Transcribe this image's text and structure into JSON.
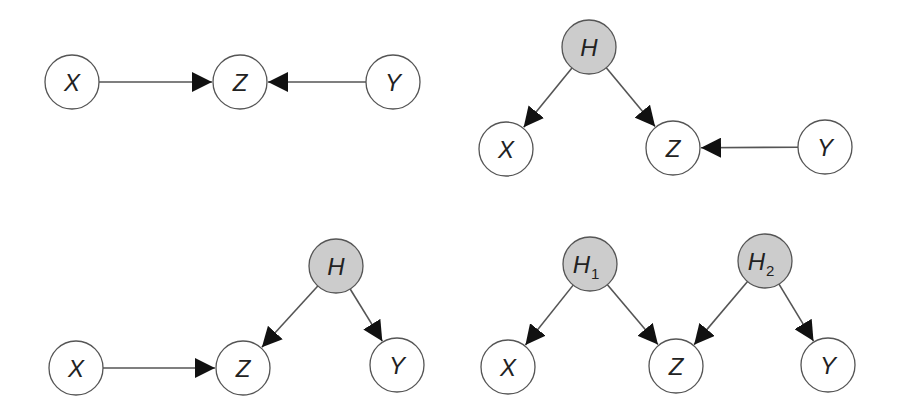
{
  "colors": {
    "observed_fill": "#ffffff",
    "hidden_fill": "#cccccc",
    "stroke": "#555555",
    "arrowhead": "#111111"
  },
  "node_radius": 27,
  "graphs": [
    {
      "id": "graph-1",
      "nodes": [
        {
          "id": "X",
          "label": "X",
          "sub": "",
          "x": 72,
          "y": 82,
          "hidden": false
        },
        {
          "id": "Z",
          "label": "Z",
          "sub": "",
          "x": 240,
          "y": 82,
          "hidden": false
        },
        {
          "id": "Y",
          "label": "Y",
          "sub": "",
          "x": 393,
          "y": 82,
          "hidden": false
        }
      ],
      "edges": [
        {
          "from": "X",
          "to": "Z"
        },
        {
          "from": "Y",
          "to": "Z"
        }
      ]
    },
    {
      "id": "graph-2",
      "nodes": [
        {
          "id": "H",
          "label": "H",
          "sub": "",
          "x": 589,
          "y": 47,
          "hidden": true
        },
        {
          "id": "X",
          "label": "X",
          "sub": "",
          "x": 506,
          "y": 149,
          "hidden": false
        },
        {
          "id": "Z",
          "label": "Z",
          "sub": "",
          "x": 673,
          "y": 148,
          "hidden": false
        },
        {
          "id": "Y",
          "label": "Y",
          "sub": "",
          "x": 825,
          "y": 147,
          "hidden": false
        }
      ],
      "edges": [
        {
          "from": "H",
          "to": "X"
        },
        {
          "from": "H",
          "to": "Z"
        },
        {
          "from": "Y",
          "to": "Z"
        }
      ]
    },
    {
      "id": "graph-3",
      "nodes": [
        {
          "id": "H",
          "label": "H",
          "sub": "",
          "x": 336,
          "y": 266,
          "hidden": true
        },
        {
          "id": "X",
          "label": "X",
          "sub": "",
          "x": 76,
          "y": 368,
          "hidden": false
        },
        {
          "id": "Z",
          "label": "Z",
          "sub": "",
          "x": 243,
          "y": 368,
          "hidden": false
        },
        {
          "id": "Y",
          "label": "Y",
          "sub": "",
          "x": 397,
          "y": 365,
          "hidden": false
        }
      ],
      "edges": [
        {
          "from": "X",
          "to": "Z"
        },
        {
          "from": "H",
          "to": "Z"
        },
        {
          "from": "H",
          "to": "Y"
        }
      ]
    },
    {
      "id": "graph-4",
      "nodes": [
        {
          "id": "H1",
          "label": "H",
          "sub": "1",
          "x": 590,
          "y": 264,
          "hidden": true
        },
        {
          "id": "H2",
          "label": "H",
          "sub": "2",
          "x": 765,
          "y": 261,
          "hidden": true
        },
        {
          "id": "X",
          "label": "X",
          "sub": "",
          "x": 508,
          "y": 367,
          "hidden": false
        },
        {
          "id": "Z",
          "label": "Z",
          "sub": "",
          "x": 676,
          "y": 366,
          "hidden": false
        },
        {
          "id": "Y",
          "label": "Y",
          "sub": "",
          "x": 828,
          "y": 365,
          "hidden": false
        }
      ],
      "edges": [
        {
          "from": "H1",
          "to": "X"
        },
        {
          "from": "H1",
          "to": "Z"
        },
        {
          "from": "H2",
          "to": "Z"
        },
        {
          "from": "H2",
          "to": "Y"
        }
      ]
    }
  ]
}
